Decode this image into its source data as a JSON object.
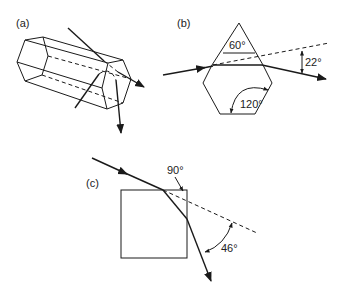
{
  "panels": {
    "a": {
      "label": "(a)",
      "description": "Hexagonal ice prism with two ray paths"
    },
    "b": {
      "label": "(b)",
      "apex_angle": "60°",
      "interior_angle": "120°",
      "deviation_angle": "22°"
    },
    "c": {
      "label": "(c)",
      "corner_angle": "90°",
      "deviation_angle": "46°"
    }
  },
  "colors": {
    "line": "#1a1a1a",
    "background": "#ffffff"
  }
}
